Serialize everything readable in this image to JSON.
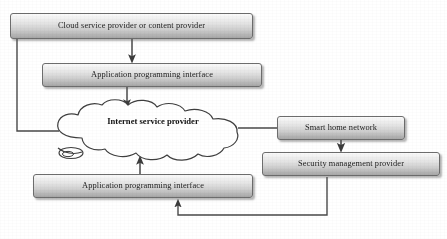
{
  "diagram": {
    "type": "flowchart",
    "background_color": "#ffffff",
    "node_fill_top_color": "#fbfbfb",
    "node_fill_bottom_color": "#a6a6a6",
    "node_border_color": "#6d6d6d",
    "line_color": "#4a4a4a",
    "nodes": [
      {
        "id": "cloud-service-provider",
        "label": "Cloud service provider or content provider",
        "shape": "rounded-rectangle",
        "x": 10,
        "y": 13,
        "w": 243,
        "h": 26
      },
      {
        "id": "api-top",
        "label": "Application programming interface",
        "shape": "rounded-rectangle",
        "x": 42,
        "y": 63,
        "w": 220,
        "h": 24
      },
      {
        "id": "internet-service-provider",
        "label": "Internet service provider",
        "shape": "cloud",
        "x": 50,
        "y": 100,
        "w": 205,
        "h": 64
      },
      {
        "id": "smart-home-network",
        "label": "Smart home network",
        "shape": "rounded-rectangle",
        "x": 277,
        "y": 116,
        "w": 128,
        "h": 24
      },
      {
        "id": "security-management-provider",
        "label": "Security management provider",
        "shape": "rounded-rectangle",
        "x": 262,
        "y": 152,
        "w": 178,
        "h": 24
      },
      {
        "id": "api-bottom",
        "label": "Application programming interface",
        "shape": "rounded-rectangle",
        "x": 33,
        "y": 174,
        "w": 220,
        "h": 24
      }
    ],
    "connectors": [
      {
        "id": "cloud-provider-to-api-top",
        "from": "cloud-service-provider",
        "to": "api-top",
        "arrow": "to",
        "style": "straight-vertical"
      },
      {
        "id": "api-top-to-isp",
        "from": "api-top",
        "to": "internet-service-provider",
        "arrow": "to",
        "style": "straight-vertical"
      },
      {
        "id": "cloud-provider-to-isp",
        "from": "cloud-service-provider",
        "to": "internet-service-provider",
        "arrow": "none",
        "style": "elbow-left"
      },
      {
        "id": "isp-to-smart-home-network",
        "from": "internet-service-provider",
        "to": "smart-home-network",
        "arrow": "none",
        "style": "straight-horizontal"
      },
      {
        "id": "smart-home-network-to-security",
        "from": "smart-home-network",
        "to": "security-management-provider",
        "arrow": "to",
        "style": "straight-vertical"
      },
      {
        "id": "security-to-api-bottom",
        "from": "security-management-provider",
        "to": "api-bottom",
        "arrow": "to",
        "style": "elbow-bottom"
      },
      {
        "id": "api-bottom-to-isp",
        "from": "api-bottom",
        "to": "internet-service-provider",
        "arrow": "to",
        "style": "straight-vertical"
      }
    ]
  }
}
